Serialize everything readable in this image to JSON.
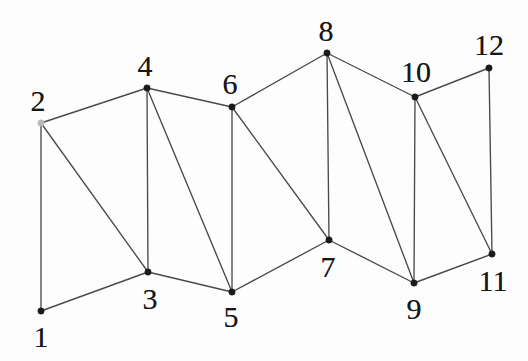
{
  "figure": {
    "width": 528,
    "height": 361,
    "background_color": "#fdfdfd",
    "edge_color": "#4a4a4a",
    "vertex_color": "#1a1a1a",
    "label_color": "#171717"
  },
  "chart_data": {
    "type": "diagram",
    "subtype": "node-link-graph",
    "title": "",
    "xlabel": "",
    "ylabel": "",
    "grid": false,
    "legend": null,
    "node_count": 12,
    "edge_count": 21,
    "nodes": [
      {
        "id": 1,
        "label": "1",
        "x": 41,
        "y": 311,
        "label_x": 41,
        "label_y": 337,
        "faint": false
      },
      {
        "id": 2,
        "label": "2",
        "x": 41,
        "y": 123,
        "label_x": 38,
        "label_y": 101,
        "faint": true
      },
      {
        "id": 3,
        "label": "3",
        "x": 148,
        "y": 272,
        "label_x": 150,
        "label_y": 299,
        "faint": false
      },
      {
        "id": 4,
        "label": "4",
        "x": 147,
        "y": 88,
        "label_x": 145,
        "label_y": 66,
        "faint": false
      },
      {
        "id": 5,
        "label": "5",
        "x": 232,
        "y": 292,
        "label_x": 231,
        "label_y": 317,
        "faint": false
      },
      {
        "id": 6,
        "label": "6",
        "x": 232,
        "y": 107,
        "label_x": 230,
        "label_y": 84,
        "faint": false
      },
      {
        "id": 7,
        "label": "7",
        "x": 329,
        "y": 240,
        "label_x": 328,
        "label_y": 267,
        "faint": false
      },
      {
        "id": 8,
        "label": "8",
        "x": 327,
        "y": 53,
        "label_x": 326,
        "label_y": 31,
        "faint": false
      },
      {
        "id": 9,
        "label": "9",
        "x": 414,
        "y": 283,
        "label_x": 414,
        "label_y": 309,
        "faint": false
      },
      {
        "id": 10,
        "label": "10",
        "x": 415,
        "y": 97,
        "label_x": 416,
        "label_y": 72,
        "faint": false
      },
      {
        "id": 11,
        "label": "11",
        "x": 492,
        "y": 254,
        "label_x": 493,
        "label_y": 281,
        "faint": false
      },
      {
        "id": 12,
        "label": "12",
        "x": 489,
        "y": 68,
        "label_x": 489,
        "label_y": 45,
        "faint": false
      }
    ],
    "edges": [
      {
        "source": 1,
        "target": 2
      },
      {
        "source": 1,
        "target": 3
      },
      {
        "source": 2,
        "target": 3
      },
      {
        "source": 2,
        "target": 4
      },
      {
        "source": 3,
        "target": 4
      },
      {
        "source": 3,
        "target": 5
      },
      {
        "source": 4,
        "target": 5
      },
      {
        "source": 4,
        "target": 6
      },
      {
        "source": 5,
        "target": 6
      },
      {
        "source": 5,
        "target": 7
      },
      {
        "source": 6,
        "target": 7
      },
      {
        "source": 6,
        "target": 8
      },
      {
        "source": 7,
        "target": 8
      },
      {
        "source": 7,
        "target": 9
      },
      {
        "source": 8,
        "target": 9
      },
      {
        "source": 8,
        "target": 10
      },
      {
        "source": 9,
        "target": 10
      },
      {
        "source": 9,
        "target": 11
      },
      {
        "source": 10,
        "target": 11
      },
      {
        "source": 10,
        "target": 12
      },
      {
        "source": 11,
        "target": 12
      }
    ]
  }
}
